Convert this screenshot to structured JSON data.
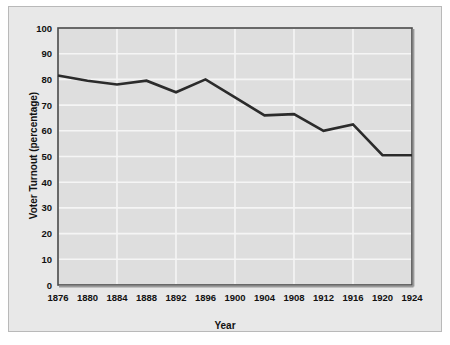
{
  "chart_data": {
    "type": "line",
    "title": "",
    "xlabel": "Year",
    "ylabel": "Voter Turnout (percentage)",
    "x": [
      1876,
      1880,
      1884,
      1888,
      1892,
      1896,
      1900,
      1904,
      1908,
      1912,
      1916,
      1920,
      1924
    ],
    "categories": [
      "1876",
      "1880",
      "1884",
      "1888",
      "1892",
      "1896",
      "1900",
      "1904",
      "1908",
      "1912",
      "1916",
      "1920",
      "1924"
    ],
    "values": [
      81.5,
      79.5,
      78,
      79.5,
      75,
      80,
      73,
      66,
      66.5,
      60,
      62.5,
      50.5,
      50.5
    ],
    "series": [
      {
        "name": "Voter Turnout",
        "values": [
          81.5,
          79.5,
          78,
          79.5,
          75,
          80,
          73,
          66,
          66.5,
          60,
          62.5,
          50.5,
          50.5
        ]
      }
    ],
    "xlim": [
      1876,
      1924
    ],
    "ylim": [
      0,
      100
    ],
    "ytick_labels": [
      "0",
      "10",
      "20",
      "30",
      "40",
      "50",
      "60",
      "70",
      "80",
      "90",
      "100"
    ],
    "yticks": [
      0,
      10,
      20,
      30,
      40,
      50,
      60,
      70,
      80,
      90,
      100
    ],
    "xtick_labels": [
      "1876",
      "1880",
      "1884",
      "1888",
      "1892",
      "1896",
      "1900",
      "1904",
      "1908",
      "1912",
      "1916",
      "1920",
      "1924"
    ],
    "grid": true,
    "legend": null,
    "legend_position": "none",
    "colors": {
      "line": "#2b2b2b",
      "plot_background": "#dedede",
      "panel_background": "#e8e8e8",
      "grid": "#f4f4f4",
      "axis": "#3a3a3a",
      "text": "#111111"
    }
  }
}
